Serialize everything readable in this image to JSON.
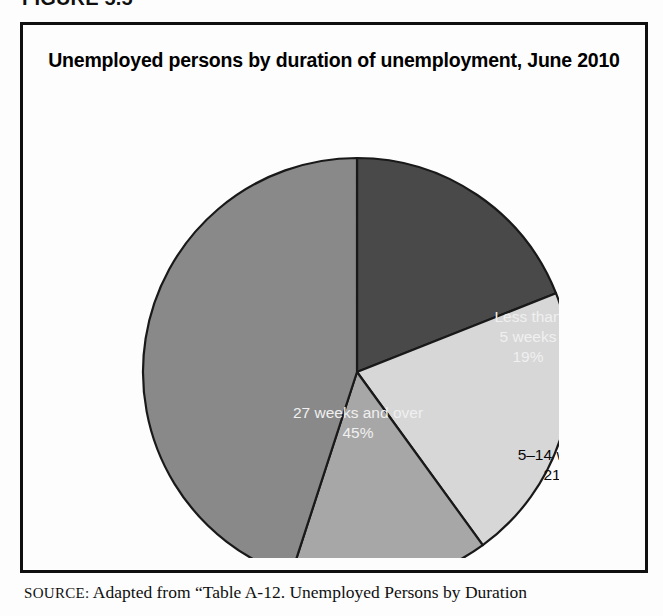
{
  "figure": {
    "number_label": "FIGURE 5.5"
  },
  "chart_title": "Unemployed persons by duration of unemployment, June 2010",
  "source": {
    "label": "SOURCE:",
    "text": " Adapted from “Table A-12. Unemployed Persons by Duration"
  },
  "colors": {
    "slice_less_than_5": "#4a4a4a",
    "slice_5_14": "#d9d9d9",
    "slice_15_26": "#a9a9a9",
    "slice_27_over": "#8b8b8b",
    "outline": "#1a1a1a",
    "label_on_dark": "#f2f2f2",
    "label_on_light": "#0a0a0a",
    "frame": "#111111"
  },
  "chart_data": {
    "type": "pie",
    "title": "Unemployed persons by duration of unemployment, June 2010",
    "xlabel": "",
    "ylabel": "",
    "value_unit": "percent",
    "start_angle_deg": 0,
    "direction": "clockwise",
    "legend_position": "none (labels drawn inside slices)",
    "grid": false,
    "categories": [
      "Less than 5 weeks",
      "5–14 weeks",
      "15–26 weeks",
      "27 weeks and over"
    ],
    "values": [
      19,
      21,
      15,
      45
    ],
    "slices": [
      {
        "label_line1": "Less than",
        "label_line2": "5 weeks",
        "label_value": "19%",
        "category": "Less than 5 weeks",
        "value": 19,
        "color": "#4a4a4a",
        "text_tone": "on-dark",
        "start_deg": 0,
        "end_deg": 68.4,
        "label_x": 405,
        "label_y": 232
      },
      {
        "label_line1": "5–14 weeks",
        "label_line2": "",
        "label_value": "21%",
        "category": "5–14 weeks",
        "value": 21,
        "color": "#d9d9d9",
        "text_tone": "on-light",
        "start_deg": 68.4,
        "end_deg": 144.0,
        "label_x": 436,
        "label_y": 360
      },
      {
        "label_line1": "15–26 weeks",
        "label_line2": "",
        "label_value": "15%",
        "category": "15–26 weeks",
        "value": 15,
        "color": "#a9a9a9",
        "text_tone": "on-light",
        "start_deg": 144.0,
        "end_deg": 198.0,
        "label_x": 348,
        "label_y": 492
      },
      {
        "label_line1": "27 weeks and over",
        "label_line2": "",
        "label_value": "45%",
        "category": "27 weeks and over",
        "value": 45,
        "color": "#8b8b8b",
        "text_tone": "on-dark",
        "label_x": 235,
        "label_y": 318,
        "start_deg": 198.0,
        "end_deg": 360.0
      }
    ],
    "geometry": {
      "cx": 234,
      "cy": 266,
      "r": 214
    }
  }
}
